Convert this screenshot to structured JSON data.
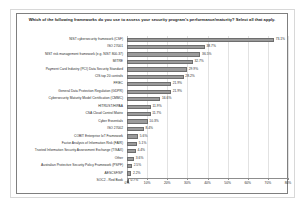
{
  "chart_data": {
    "type": "bar",
    "orientation": "horizontal",
    "title": "Which of the following frameworks do you use to assess your security program's performance/maturity? Select all that apply.",
    "xlabel": "",
    "ylabel": "",
    "xlim": [
      0,
      80
    ],
    "grid": true,
    "legend": false,
    "bar_color": "#9a9a9a",
    "xticks": [
      "0%",
      "10%",
      "20%",
      "30%",
      "40%",
      "50%",
      "60%",
      "70%",
      "80%"
    ],
    "xtick_values": [
      0,
      10,
      20,
      30,
      40,
      50,
      60,
      70,
      80
    ],
    "categories": [
      "NIST cybersecurity framework (CSF)",
      "ISO 27001",
      "NIST risk management framework (e.g. NIST 800-37)",
      "MITRE",
      "Payment Card Industry (PCI) Data Security Standard",
      "CIS top 20 controls",
      "FFIEC",
      "General Data Protection Regulation (GDPR)",
      "Cybersecurity Maturity Model Certification (CMMC)",
      "HITRUST/HIPAA",
      "CSA Cloud Control Matrix",
      "Cyber Essentials",
      "ISO 27002",
      "COBIT Enterprise IoT Framework",
      "Factor Analysis of Information Risk (FAIR)",
      "Trusted Information Security Assessment Exchange (TISAX)",
      "Other",
      "Australian Protective Security Policy Framework (PSPF)",
      "AESCSF/SP",
      "SOC2 - Red Book"
    ],
    "values": [
      73.1,
      38.7,
      36.5,
      32.7,
      29.9,
      28.2,
      21.9,
      21.9,
      16.6,
      11.9,
      11.7,
      10.3,
      8.4,
      5.6,
      5.1,
      4.4,
      3.6,
      2.5,
      2.2,
      0.7
    ],
    "value_labels": [
      "73.1%",
      "38.7%",
      "36.5%",
      "32.7%",
      "29.9%",
      "28.2%",
      "21.9%",
      "21.9%",
      "16.6%",
      "11.9%",
      "11.7%",
      "10.3%",
      "8.4%",
      "5.6%",
      "5.1%",
      "4.4%",
      "3.6%",
      "2.5%",
      "2.2%",
      "0.7%"
    ]
  }
}
